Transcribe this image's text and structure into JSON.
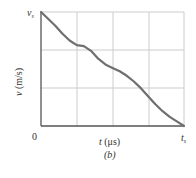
{
  "chart_data": {
    "type": "line",
    "title": "",
    "caption": "(b)",
    "xlabel": "t (μs)",
    "ylabel": "v (m/s)",
    "x_tick_labels": [
      "0",
      "t_s"
    ],
    "y_tick_labels": [
      "v_s"
    ],
    "grid": true,
    "grid_divisions": {
      "x": 4,
      "y": 3
    },
    "xlim": [
      0,
      1
    ],
    "ylim": [
      0,
      1
    ],
    "series": [
      {
        "name": "velocity",
        "x": [
          0.0,
          0.05,
          0.1,
          0.15,
          0.2,
          0.25,
          0.3,
          0.35,
          0.4,
          0.45,
          0.5,
          0.55,
          0.6,
          0.65,
          0.7,
          0.75,
          0.8,
          0.85,
          0.9,
          0.95,
          1.0
        ],
        "values": [
          1.0,
          0.94,
          0.88,
          0.81,
          0.75,
          0.71,
          0.7,
          0.66,
          0.59,
          0.54,
          0.51,
          0.48,
          0.44,
          0.39,
          0.33,
          0.26,
          0.19,
          0.13,
          0.08,
          0.04,
          0.0
        ]
      }
    ],
    "line_color": "#6f6f6f",
    "grid_color": "#cccccc",
    "axis_color": "#555555"
  },
  "labels": {
    "y_top": "v",
    "y_top_sub": "s",
    "origin": "0",
    "x_right": "t",
    "x_right_sub": "s",
    "xlabel_t": "t",
    "xlabel_unit": "(μs)",
    "ylabel_v": "v",
    "ylabel_unit": "(m/s)",
    "caption": "(b)"
  }
}
